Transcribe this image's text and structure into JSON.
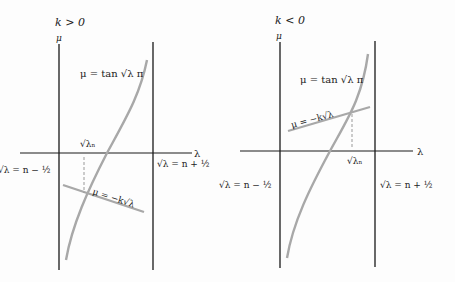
{
  "panels": [
    {
      "id": "left",
      "condition": "k > 0",
      "y_axis_label": "μ",
      "x_axis_label": "λ",
      "curve_label": "μ = tan √λ π",
      "line_label": "μ = −k√λ",
      "intersection_label": "√λₙ",
      "left_bound_label": "√λ = n − ½",
      "right_bound_label": "√λ = n + ½"
    },
    {
      "id": "right",
      "condition": "k < 0",
      "y_axis_label": "μ",
      "x_axis_label": "λ",
      "curve_label": "μ = tan √λ π",
      "line_label": "μ = −k√λ",
      "intersection_label": "√λₙ",
      "left_bound_label": "√λ = n − ½",
      "right_bound_label": "√λ = n + ½"
    }
  ],
  "colors": {
    "axis": "#1a1a1a",
    "curve": "#a8a8a8",
    "line": "#a8a8a8",
    "dashed": "#999999",
    "background": "#fdfdfd"
  }
}
